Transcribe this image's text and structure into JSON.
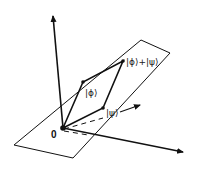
{
  "diagram": {
    "origin_label": "0",
    "labels": {
      "phi": "|ϕ⟩",
      "psi": "|ψ⟩",
      "sum": "|ϕ⟩+|ψ⟩"
    },
    "colors": {
      "stroke": "#111111",
      "background": "#ffffff"
    }
  }
}
